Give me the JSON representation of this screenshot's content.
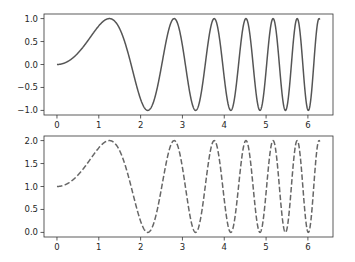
{
  "chart_data": [
    {
      "type": "line",
      "title": "",
      "xlabel": "",
      "ylabel": "",
      "function": "sin(x^2)",
      "line_style": "solid",
      "color": "#555555",
      "x_range": [
        0,
        6.2832
      ],
      "xlim": [
        -0.31,
        6.6
      ],
      "ylim": [
        -1.1,
        1.1
      ],
      "xticks": [
        0,
        1,
        2,
        3,
        4,
        5,
        6
      ],
      "xtick_labels": [
        "0",
        "1",
        "2",
        "3",
        "4",
        "5",
        "6"
      ],
      "yticks": [
        -1.0,
        -0.5,
        0.0,
        0.5,
        1.0
      ],
      "ytick_labels": [
        "−1.0",
        "−0.5",
        "0.0",
        "0.5",
        "1.0"
      ],
      "grid": false,
      "legend": null
    },
    {
      "type": "line",
      "title": "",
      "xlabel": "",
      "ylabel": "",
      "function": "sin(x^2) + 1",
      "line_style": "dashed",
      "color": "#666666",
      "x_range": [
        0,
        6.2832
      ],
      "xlim": [
        -0.31,
        6.6
      ],
      "ylim": [
        -0.1,
        2.1
      ],
      "xticks": [
        0,
        1,
        2,
        3,
        4,
        5,
        6
      ],
      "xtick_labels": [
        "0",
        "1",
        "2",
        "3",
        "4",
        "5",
        "6"
      ],
      "yticks": [
        0.0,
        0.5,
        1.0,
        1.5,
        2.0
      ],
      "ytick_labels": [
        "0.0",
        "0.5",
        "1.0",
        "1.5",
        "2.0"
      ],
      "grid": false,
      "legend": null
    }
  ]
}
